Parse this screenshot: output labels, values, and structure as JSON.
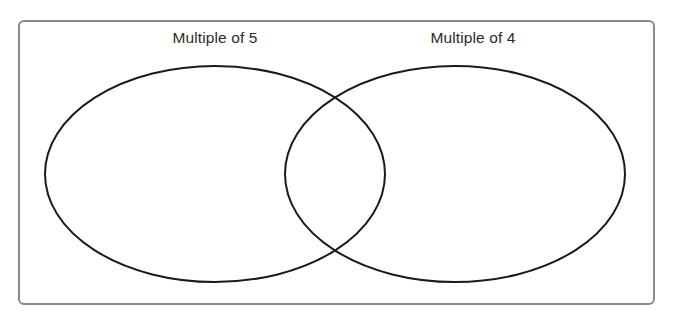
{
  "page": {
    "background_color": "#ffffff",
    "width": 673,
    "height": 322
  },
  "venn": {
    "frame": {
      "border_color": "#8a8a8a",
      "fill_color": "#ffffff",
      "border_width": 2,
      "corner_radius": 6
    },
    "stroke_color": "#1a1a1a",
    "stroke_width": 2,
    "left_set": {
      "label": "Multiple of 5",
      "center_x": 215,
      "center_y": 174,
      "radius_x": 170,
      "radius_y": 108
    },
    "right_set": {
      "label": "Multiple of 4",
      "center_x": 455,
      "center_y": 174,
      "radius_x": 170,
      "radius_y": 108
    },
    "label_color": "#2b2b2b",
    "label_font_size": "15.5px"
  }
}
